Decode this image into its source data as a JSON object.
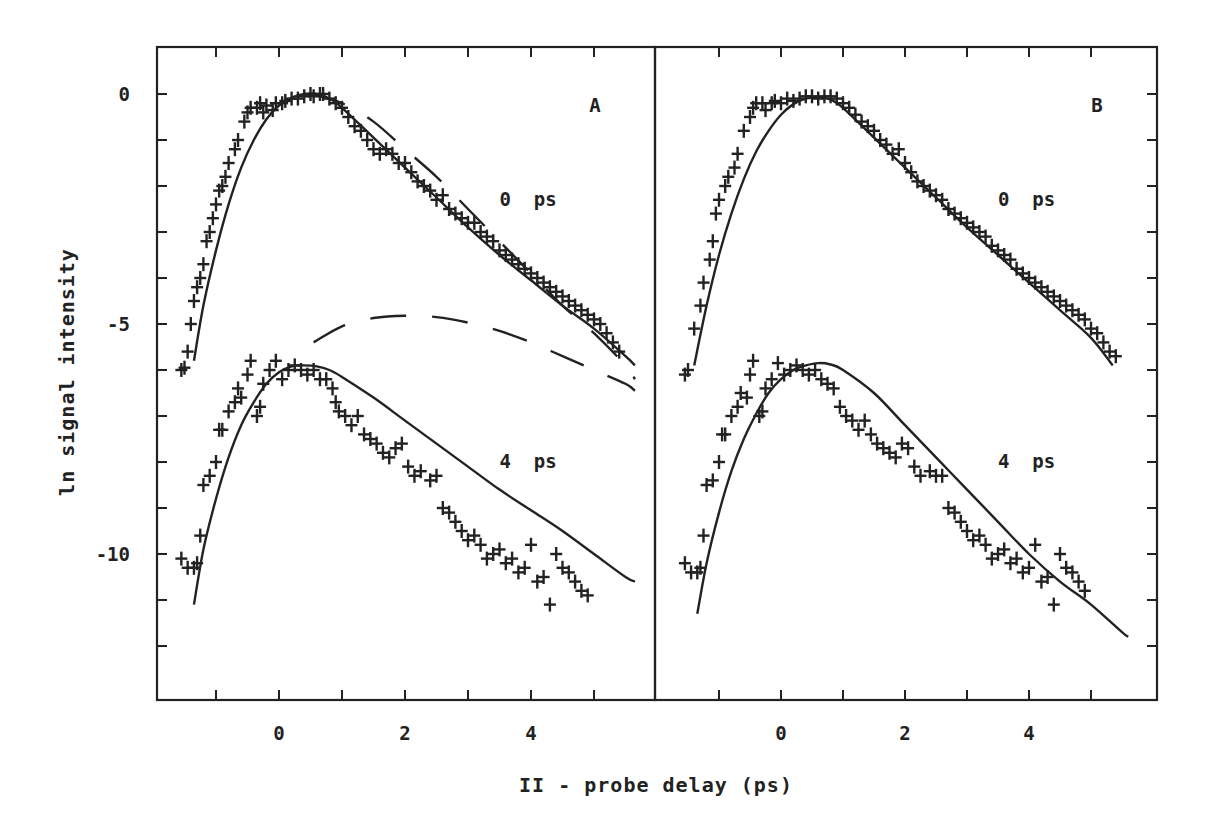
{
  "chart_data": {
    "type": "scatter",
    "title": "",
    "xlabel": "II - probe delay (ps)",
    "ylabel": "ln signal intensity",
    "shared_y_axis": true,
    "grid": false,
    "ylim": [
      -13,
      1
    ],
    "yticks": [
      0,
      -5,
      -10
    ],
    "ytick_labels": [
      "0",
      "-5",
      "-10"
    ],
    "panels": [
      {
        "id": "A",
        "label": "A",
        "xlim": [
          -2,
          6
        ],
        "xticks": [
          0,
          2,
          4
        ],
        "xtick_labels": [
          "0",
          "2",
          "4"
        ],
        "annotations": [
          {
            "text": "0 ps",
            "x": 3.5,
            "y": -2.3
          },
          {
            "text": "4 ps",
            "x": 3.5,
            "y": -8.0
          }
        ],
        "series": [
          {
            "name": "0 ps data",
            "style": "markers-plus",
            "x": [
              -1.55,
              -1.5,
              -1.45,
              -1.4,
              -1.35,
              -1.3,
              -1.25,
              -1.2,
              -1.15,
              -1.1,
              -1.05,
              -1.0,
              -0.95,
              -0.9,
              -0.85,
              -0.8,
              -0.7,
              -0.65,
              -0.55,
              -0.5,
              -0.45,
              -0.35,
              -0.3,
              -0.25,
              -0.2,
              -0.1,
              -0.05,
              0.05,
              0.1,
              0.2,
              0.3,
              0.4,
              0.5,
              0.55,
              0.65,
              0.7,
              0.8,
              0.9,
              1.0,
              1.1,
              1.2,
              1.3,
              1.4,
              1.5,
              1.6,
              1.7,
              1.8,
              1.9,
              2.0,
              2.1,
              2.2,
              2.3,
              2.4,
              2.5,
              2.6,
              2.7,
              2.8,
              2.9,
              3.0,
              3.1,
              3.2,
              3.3,
              3.4,
              3.5,
              3.6,
              3.7,
              3.8,
              3.9,
              4.0,
              4.1,
              4.2,
              4.3,
              4.4,
              4.5,
              4.6,
              4.7,
              4.8,
              4.9,
              5.0,
              5.1,
              5.2,
              5.3,
              5.4
            ],
            "y": [
              -6.0,
              -5.95,
              -5.6,
              -5.0,
              -4.5,
              -4.2,
              -4.0,
              -3.7,
              -3.2,
              -3.0,
              -2.7,
              -2.4,
              -2.1,
              -2.0,
              -1.8,
              -1.5,
              -1.2,
              -1.0,
              -0.6,
              -0.4,
              -0.3,
              -0.3,
              -0.2,
              -0.4,
              -0.25,
              -0.35,
              -0.2,
              -0.2,
              -0.15,
              -0.1,
              -0.1,
              -0.05,
              0.0,
              -0.05,
              0.0,
              0.0,
              -0.1,
              -0.2,
              -0.3,
              -0.5,
              -0.7,
              -0.8,
              -1.0,
              -1.2,
              -1.3,
              -1.2,
              -1.3,
              -1.5,
              -1.5,
              -1.7,
              -1.9,
              -2.0,
              -2.1,
              -2.3,
              -2.2,
              -2.5,
              -2.6,
              -2.7,
              -2.8,
              -2.8,
              -3.0,
              -3.1,
              -3.2,
              -3.4,
              -3.5,
              -3.6,
              -3.7,
              -3.8,
              -3.9,
              -4.0,
              -4.1,
              -4.2,
              -4.3,
              -4.4,
              -4.5,
              -4.6,
              -4.7,
              -4.8,
              -4.9,
              -5.0,
              -5.2,
              -5.4,
              -5.6
            ]
          },
          {
            "name": "0 ps fit",
            "style": "solid",
            "x": [
              -1.35,
              -1.2,
              -1.0,
              -0.8,
              -0.6,
              -0.4,
              -0.2,
              0.0,
              0.2,
              0.4,
              0.6,
              0.8,
              1.0,
              1.5,
              2.0,
              2.5,
              3.0,
              3.5,
              4.0,
              4.5,
              5.0,
              5.5,
              5.65
            ],
            "y": [
              -5.8,
              -4.6,
              -3.4,
              -2.4,
              -1.6,
              -1.0,
              -0.55,
              -0.25,
              -0.08,
              0.0,
              0.0,
              -0.1,
              -0.3,
              -0.95,
              -1.6,
              -2.25,
              -2.9,
              -3.5,
              -4.05,
              -4.6,
              -5.1,
              -5.7,
              -5.9
            ]
          },
          {
            "name": "0 ps model (dashed)",
            "style": "dashed",
            "x": [
              0.5,
              1.0,
              1.5,
              2.0,
              2.5,
              3.0,
              3.5,
              4.0,
              4.5,
              5.0,
              5.5,
              5.65
            ],
            "y": [
              0.0,
              -0.2,
              -0.6,
              -1.2,
              -1.8,
              -2.5,
              -3.2,
              -3.9,
              -4.6,
              -5.2,
              -5.9,
              -6.2
            ]
          },
          {
            "name": "4 ps data",
            "style": "markers-plus",
            "x": [
              -1.55,
              -1.45,
              -1.35,
              -1.3,
              -1.25,
              -1.2,
              -1.1,
              -1.0,
              -0.95,
              -0.9,
              -0.8,
              -0.7,
              -0.65,
              -0.6,
              -0.5,
              -0.45,
              -0.35,
              -0.3,
              -0.25,
              -0.15,
              -0.05,
              0.05,
              0.15,
              0.25,
              0.35,
              0.45,
              0.55,
              0.65,
              0.75,
              0.85,
              0.9,
              0.95,
              1.05,
              1.15,
              1.25,
              1.35,
              1.45,
              1.55,
              1.65,
              1.75,
              1.85,
              1.95,
              2.05,
              2.15,
              2.25,
              2.4,
              2.5,
              2.6,
              2.7,
              2.8,
              2.9,
              3.0,
              3.1,
              3.2,
              3.3,
              3.4,
              3.5,
              3.6,
              3.7,
              3.8,
              3.9,
              4.0,
              4.1,
              4.2,
              4.3,
              4.4,
              4.5,
              4.6,
              4.7,
              4.8,
              4.9
            ],
            "y": [
              -10.1,
              -10.3,
              -10.3,
              -10.2,
              -9.6,
              -8.5,
              -8.3,
              -8.0,
              -7.3,
              -7.3,
              -6.9,
              -6.7,
              -6.4,
              -6.6,
              -6.1,
              -5.8,
              -7.0,
              -6.8,
              -6.3,
              -6.0,
              -5.8,
              -6.2,
              -6.0,
              -5.9,
              -6.0,
              -6.1,
              -6.0,
              -6.2,
              -6.2,
              -6.4,
              -6.7,
              -6.9,
              -7.0,
              -7.2,
              -7.0,
              -7.4,
              -7.5,
              -7.6,
              -7.8,
              -7.9,
              -7.7,
              -7.6,
              -8.1,
              -8.3,
              -8.2,
              -8.4,
              -8.3,
              -9.0,
              -9.1,
              -9.3,
              -9.5,
              -9.7,
              -9.6,
              -9.8,
              -10.1,
              -10.0,
              -9.9,
              -10.2,
              -10.1,
              -10.4,
              -10.3,
              -9.8,
              -10.6,
              -10.5,
              -11.1,
              -10.0,
              -10.3,
              -10.4,
              -10.6,
              -10.8,
              -10.9
            ]
          },
          {
            "name": "4 ps fit",
            "style": "solid",
            "x": [
              -1.35,
              -1.2,
              -1.0,
              -0.8,
              -0.6,
              -0.4,
              -0.2,
              0.0,
              0.2,
              0.4,
              0.6,
              0.8,
              1.0,
              1.5,
              2.0,
              2.5,
              3.0,
              3.5,
              4.0,
              4.5,
              5.0,
              5.5,
              5.65
            ],
            "y": [
              -11.1,
              -9.9,
              -8.8,
              -7.9,
              -7.2,
              -6.7,
              -6.3,
              -6.05,
              -5.92,
              -5.9,
              -5.92,
              -6.0,
              -6.15,
              -6.6,
              -7.1,
              -7.6,
              -8.1,
              -8.6,
              -9.05,
              -9.5,
              -10.0,
              -10.5,
              -10.6
            ]
          },
          {
            "name": "4 ps model (dashed)",
            "style": "dashed",
            "x": [
              0.55,
              1.0,
              1.5,
              2.0,
              2.5,
              3.0,
              3.5,
              4.0,
              4.5,
              5.0,
              5.5,
              5.65
            ],
            "y": [
              -5.4,
              -5.05,
              -4.87,
              -4.82,
              -4.85,
              -4.97,
              -5.15,
              -5.4,
              -5.7,
              -6.0,
              -6.3,
              -6.45
            ]
          }
        ]
      },
      {
        "id": "B",
        "label": "B",
        "xlim": [
          -2,
          6
        ],
        "xticks": [
          0,
          2,
          4
        ],
        "xtick_labels": [
          "0",
          "2",
          "4"
        ],
        "annotations": [
          {
            "text": "0 ps",
            "x": 3.5,
            "y": -2.3
          },
          {
            "text": "4 ps",
            "x": 3.5,
            "y": -8.0
          }
        ],
        "series": [
          {
            "name": "0 ps data",
            "style": "markers-plus",
            "x": [
              -1.55,
              -1.5,
              -1.4,
              -1.3,
              -1.25,
              -1.15,
              -1.1,
              -1.05,
              -1.0,
              -0.9,
              -0.85,
              -0.75,
              -0.7,
              -0.6,
              -0.5,
              -0.45,
              -0.4,
              -0.3,
              -0.25,
              -0.15,
              -0.1,
              0.0,
              0.1,
              0.2,
              0.3,
              0.4,
              0.5,
              0.6,
              0.7,
              0.8,
              0.9,
              1.0,
              1.1,
              1.2,
              1.3,
              1.4,
              1.5,
              1.6,
              1.7,
              1.8,
              1.9,
              2.0,
              2.1,
              2.2,
              2.3,
              2.4,
              2.5,
              2.6,
              2.7,
              2.8,
              2.9,
              3.0,
              3.1,
              3.2,
              3.3,
              3.4,
              3.5,
              3.6,
              3.7,
              3.8,
              3.9,
              4.0,
              4.1,
              4.2,
              4.3,
              4.4,
              4.5,
              4.6,
              4.7,
              4.8,
              4.9,
              5.0,
              5.1,
              5.2,
              5.3,
              5.4
            ],
            "y": [
              -6.1,
              -6.0,
              -5.1,
              -4.6,
              -4.1,
              -3.6,
              -3.2,
              -2.6,
              -2.3,
              -2.0,
              -1.8,
              -1.6,
              -1.3,
              -0.8,
              -0.5,
              -0.3,
              -0.2,
              -0.2,
              -0.35,
              -0.2,
              -0.15,
              -0.2,
              -0.1,
              -0.15,
              -0.1,
              -0.05,
              -0.05,
              -0.1,
              -0.05,
              -0.05,
              -0.1,
              -0.2,
              -0.3,
              -0.45,
              -0.6,
              -0.7,
              -0.8,
              -1.0,
              -1.1,
              -1.3,
              -1.2,
              -1.5,
              -1.7,
              -1.9,
              -2.0,
              -2.1,
              -2.2,
              -2.3,
              -2.5,
              -2.6,
              -2.7,
              -2.8,
              -2.9,
              -3.0,
              -3.1,
              -3.3,
              -3.4,
              -3.5,
              -3.6,
              -3.8,
              -3.9,
              -4.0,
              -4.1,
              -4.2,
              -4.3,
              -4.4,
              -4.5,
              -4.6,
              -4.7,
              -4.8,
              -4.9,
              -5.1,
              -5.2,
              -5.4,
              -5.6,
              -5.7
            ]
          },
          {
            "name": "0 ps fit",
            "style": "solid",
            "x": [
              -1.4,
              -1.2,
              -1.0,
              -0.8,
              -0.6,
              -0.4,
              -0.2,
              0.0,
              0.2,
              0.4,
              0.6,
              0.8,
              1.0,
              1.5,
              2.0,
              2.5,
              3.0,
              3.5,
              4.0,
              4.5,
              5.0,
              5.35
            ],
            "y": [
              -5.9,
              -4.6,
              -3.5,
              -2.6,
              -1.85,
              -1.25,
              -0.8,
              -0.45,
              -0.22,
              -0.1,
              -0.08,
              -0.12,
              -0.3,
              -0.95,
              -1.6,
              -2.25,
              -2.9,
              -3.5,
              -4.1,
              -4.7,
              -5.3,
              -5.9
            ]
          },
          {
            "name": "4 ps data",
            "style": "markers-plus",
            "x": [
              -1.55,
              -1.45,
              -1.35,
              -1.3,
              -1.25,
              -1.2,
              -1.1,
              -1.0,
              -0.95,
              -0.9,
              -0.8,
              -0.7,
              -0.65,
              -0.55,
              -0.5,
              -0.45,
              -0.35,
              -0.3,
              -0.25,
              -0.15,
              -0.05,
              0.05,
              0.15,
              0.25,
              0.35,
              0.45,
              0.55,
              0.65,
              0.75,
              0.85,
              0.95,
              1.05,
              1.15,
              1.25,
              1.35,
              1.45,
              1.55,
              1.65,
              1.75,
              1.85,
              1.95,
              2.05,
              2.15,
              2.25,
              2.4,
              2.5,
              2.6,
              2.7,
              2.8,
              2.9,
              3.0,
              3.1,
              3.2,
              3.3,
              3.4,
              3.5,
              3.6,
              3.7,
              3.8,
              3.9,
              4.0,
              4.1,
              4.2,
              4.3,
              4.4,
              4.5,
              4.6,
              4.7,
              4.8,
              4.9
            ],
            "y": [
              -10.2,
              -10.4,
              -10.4,
              -10.3,
              -9.6,
              -8.5,
              -8.4,
              -8.0,
              -7.4,
              -7.4,
              -7.0,
              -6.8,
              -6.5,
              -6.6,
              -6.1,
              -5.8,
              -7.0,
              -6.9,
              -6.4,
              -6.2,
              -5.85,
              -6.1,
              -6.0,
              -5.9,
              -6.0,
              -6.1,
              -6.0,
              -6.2,
              -6.3,
              -6.4,
              -6.8,
              -7.0,
              -7.1,
              -7.3,
              -7.1,
              -7.4,
              -7.6,
              -7.7,
              -7.8,
              -7.9,
              -7.6,
              -7.7,
              -8.1,
              -8.3,
              -8.2,
              -8.3,
              -8.3,
              -9.0,
              -9.1,
              -9.3,
              -9.5,
              -9.7,
              -9.6,
              -9.8,
              -10.1,
              -10.0,
              -9.9,
              -10.2,
              -10.1,
              -10.4,
              -10.3,
              -9.8,
              -10.6,
              -10.5,
              -11.1,
              -10.0,
              -10.3,
              -10.4,
              -10.6,
              -10.8
            ]
          },
          {
            "name": "4 ps fit",
            "style": "solid",
            "x": [
              -1.35,
              -1.2,
              -1.0,
              -0.8,
              -0.6,
              -0.4,
              -0.2,
              0.0,
              0.2,
              0.4,
              0.6,
              0.8,
              1.0,
              1.5,
              2.0,
              2.5,
              3.0,
              3.5,
              4.0,
              4.5,
              5.0,
              5.5,
              5.6
            ],
            "y": [
              -11.3,
              -10.2,
              -9.1,
              -8.2,
              -7.5,
              -6.95,
              -6.5,
              -6.2,
              -6.0,
              -5.9,
              -5.85,
              -5.88,
              -6.0,
              -6.5,
              -7.2,
              -7.9,
              -8.6,
              -9.3,
              -10.0,
              -10.6,
              -11.1,
              -11.7,
              -11.8
            ]
          }
        ]
      }
    ]
  },
  "figure": {
    "y_axis_title": "ln signal intensity",
    "x_axis_title": "II - probe delay (ps)",
    "panel_labels": [
      "A",
      "B"
    ]
  }
}
